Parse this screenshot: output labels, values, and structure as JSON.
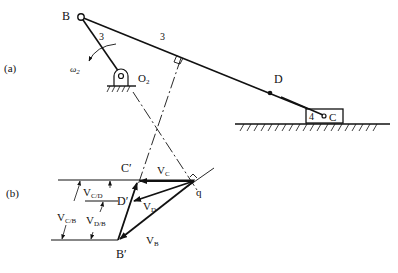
{
  "figure": {
    "part_a_label": "(a)",
    "part_b_label": "(b)",
    "mechanism": {
      "point_B": "B",
      "point_D": "D",
      "point_C": "C",
      "pivot_O2": "O",
      "pivot_O2_sub": "2",
      "omega_symbol": "ω",
      "omega_sub": "2",
      "link_label_short": "3",
      "link_label_long": "3",
      "slider_label": "4"
    },
    "velocity_polygon": {
      "pole": "q",
      "C_prime": "C′",
      "D_prime": "D′",
      "B_prime": "B′",
      "V_C": {
        "main": "V",
        "sub": "C"
      },
      "V_D": {
        "main": "V",
        "sub": "D"
      },
      "V_B": {
        "main": "V",
        "sub": "B"
      },
      "V_CD": {
        "main": "V",
        "sub": "C/D"
      },
      "V_CB": {
        "main": "V",
        "sub": "C/B"
      },
      "V_DB": {
        "main": "V",
        "sub": "D/B"
      }
    }
  }
}
